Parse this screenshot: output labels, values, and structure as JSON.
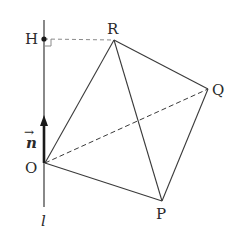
{
  "diagram": {
    "type": "geometry-tetrahedron-with-line",
    "points": {
      "H": {
        "label": "H",
        "x": 44,
        "y": 39
      },
      "R": {
        "label": "R",
        "x": 114,
        "y": 40
      },
      "Q": {
        "label": "Q",
        "x": 208,
        "y": 89
      },
      "O": {
        "label": "O",
        "x": 45,
        "y": 163
      },
      "P": {
        "label": "P",
        "x": 162,
        "y": 201
      }
    },
    "line_l": {
      "label": "l",
      "x": 44,
      "y_top": 20,
      "y_bottom": 207
    },
    "vector_n": {
      "label": "n",
      "arrow_symbol": "→",
      "from": "O",
      "tip_y": 117
    },
    "solid_edges": [
      "O-R",
      "R-Q",
      "R-P",
      "O-P",
      "P-Q"
    ],
    "dashed_edges": [
      "O-Q",
      "H-R"
    ],
    "right_angle_at": "H",
    "colors": {
      "line": "#3a3a3a",
      "dashed": "#8a8a8a",
      "label": "#2a2a2a"
    }
  }
}
